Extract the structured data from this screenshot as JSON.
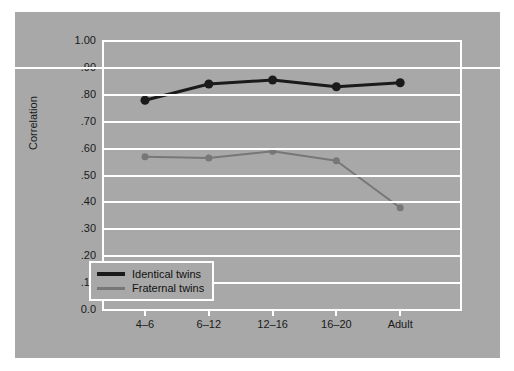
{
  "chart_data": {
    "type": "line",
    "title": "",
    "xlabel": "",
    "ylabel": "Correlation",
    "categories": [
      "4–6",
      "6–12",
      "12–16",
      "16–20",
      "Adult"
    ],
    "ylim": [
      0.0,
      1.0
    ],
    "yticks": [
      "1.00",
      ".90",
      ".80",
      ".70",
      ".60",
      ".50",
      ".40",
      ".30",
      ".20",
      ".10",
      "0.0"
    ],
    "ytick_values": [
      1.0,
      0.9,
      0.8,
      0.7,
      0.6,
      0.5,
      0.4,
      0.3,
      0.2,
      0.1,
      0.0
    ],
    "grid": true,
    "grid_color": "#ffffff",
    "background": "#a8a8a8",
    "legend_position": "bottom-left",
    "series": [
      {
        "name": "Identical twins",
        "color": "#1a1a1a",
        "line_width": 3,
        "marker_size": 9,
        "values": [
          0.78,
          0.84,
          0.855,
          0.83,
          0.845
        ]
      },
      {
        "name": "Fraternal twins",
        "color": "#777777",
        "line_width": 2,
        "marker_size": 7,
        "values": [
          0.57,
          0.565,
          0.59,
          0.555,
          0.38
        ]
      }
    ]
  },
  "legend": {
    "items": [
      {
        "label": "Identical twins"
      },
      {
        "label": "Fraternal twins"
      }
    ]
  }
}
